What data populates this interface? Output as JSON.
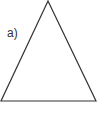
{
  "figure": {
    "label": "a)",
    "shape": "triangle-isosceles",
    "stroke_color": "#333333",
    "fill_color": "#ffffff",
    "vertices": {
      "apex": [
        48,
        1
      ],
      "bottom_left": [
        1,
        101
      ],
      "bottom_right": [
        96,
        101
      ]
    }
  }
}
